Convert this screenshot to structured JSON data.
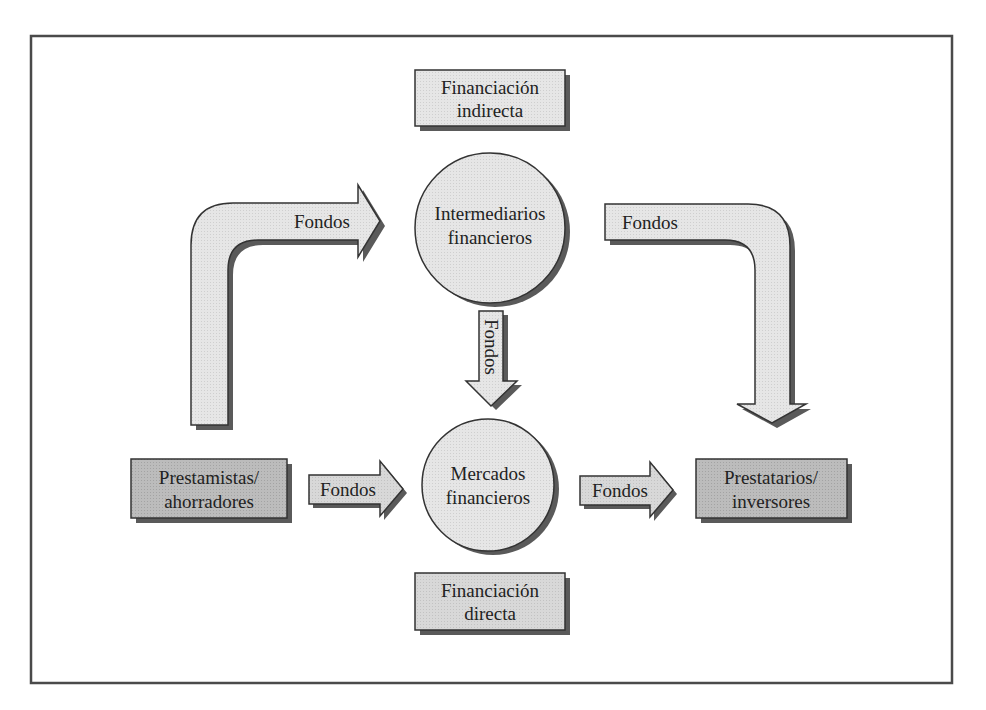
{
  "diagram": {
    "colors": {
      "frame": "#4a4a4a",
      "light_fill": "#e8e8e8",
      "box_light": "#dcdcdc",
      "box_dark": "#b9b9b9",
      "circle_fill": "#d9d9d9",
      "shadow": "#5a5a5a",
      "stroke": "#333333",
      "text": "#222222"
    },
    "nodes": {
      "indirect_label": {
        "line1": "Financiación",
        "line2": "indirecta"
      },
      "intermediaries": {
        "line1": "Intermediarios",
        "line2": "financieros"
      },
      "markets": {
        "line1": "Mercados",
        "line2": "financieros"
      },
      "direct_label": {
        "line1": "Financiación",
        "line2": "directa"
      },
      "lenders": {
        "line1": "Prestamistas/",
        "line2": "ahorradores"
      },
      "borrowers": {
        "line1": "Prestatarios/",
        "line2": "inversores"
      }
    },
    "arrows": {
      "lenders_to_intermediaries": "Fondos",
      "intermediaries_to_borrowers": "Fondos",
      "intermediaries_to_markets": "Fondos",
      "lenders_to_markets": "Fondos",
      "markets_to_borrowers": "Fondos"
    }
  }
}
